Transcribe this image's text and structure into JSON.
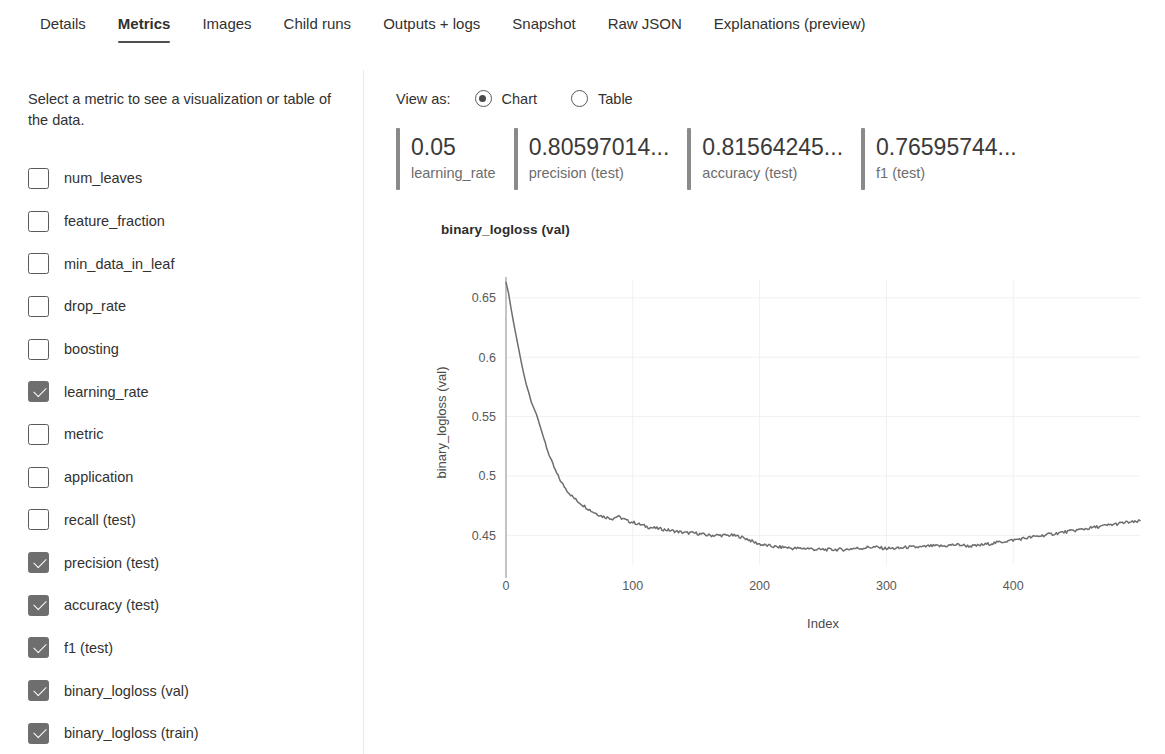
{
  "tabs": [
    {
      "label": "Details",
      "active": false
    },
    {
      "label": "Metrics",
      "active": true
    },
    {
      "label": "Images",
      "active": false
    },
    {
      "label": "Child runs",
      "active": false
    },
    {
      "label": "Outputs + logs",
      "active": false
    },
    {
      "label": "Snapshot",
      "active": false
    },
    {
      "label": "Raw JSON",
      "active": false
    },
    {
      "label": "Explanations (preview)",
      "active": false
    }
  ],
  "sidebar": {
    "help_text": "Select a metric to see a visualization or table of the data.",
    "metrics": [
      {
        "label": "num_leaves",
        "checked": false
      },
      {
        "label": "feature_fraction",
        "checked": false
      },
      {
        "label": "min_data_in_leaf",
        "checked": false
      },
      {
        "label": "drop_rate",
        "checked": false
      },
      {
        "label": "boosting",
        "checked": false
      },
      {
        "label": "learning_rate",
        "checked": true
      },
      {
        "label": "metric",
        "checked": false
      },
      {
        "label": "application",
        "checked": false
      },
      {
        "label": "recall (test)",
        "checked": false
      },
      {
        "label": "precision (test)",
        "checked": true
      },
      {
        "label": "accuracy (test)",
        "checked": true
      },
      {
        "label": "f1 (test)",
        "checked": true
      },
      {
        "label": "binary_logloss (val)",
        "checked": true
      },
      {
        "label": "binary_logloss (train)",
        "checked": true
      }
    ]
  },
  "view_as": {
    "label": "View as:",
    "options": [
      {
        "label": "Chart",
        "selected": true
      },
      {
        "label": "Table",
        "selected": false
      }
    ]
  },
  "kpi_cards": [
    {
      "value": "0.05",
      "name": "learning_rate"
    },
    {
      "value": "0.80597014...",
      "name": "precision (test)"
    },
    {
      "value": "0.81564245...",
      "name": "accuracy (test)"
    },
    {
      "value": "0.76595744...",
      "name": "f1 (test)"
    }
  ],
  "colors": {
    "accent_bar": "#8a8a8a",
    "line": "#6e6e6e",
    "checkbox_checked": "#6e6e6e",
    "tab_underline": "#4f4f4f",
    "gridline": "#f0f0f0"
  },
  "chart_data": {
    "type": "line",
    "title": "binary_logloss (val)",
    "xlabel": "Index",
    "ylabel": "binary_logloss (val)",
    "xlim": [
      0,
      500
    ],
    "ylim": [
      0.425,
      0.665
    ],
    "xticks": [
      0,
      100,
      200,
      300,
      400
    ],
    "yticks": [
      0.45,
      0.5,
      0.55,
      0.6,
      0.65
    ],
    "grid": true,
    "legend": null,
    "series": [
      {
        "name": "binary_logloss (val)",
        "x": [
          0,
          2,
          4,
          6,
          8,
          10,
          12,
          14,
          16,
          18,
          20,
          22,
          24,
          26,
          28,
          30,
          32,
          34,
          36,
          38,
          40,
          44,
          48,
          52,
          56,
          60,
          64,
          68,
          72,
          76,
          80,
          84,
          88,
          92,
          96,
          100,
          106,
          112,
          118,
          124,
          130,
          136,
          142,
          148,
          154,
          160,
          166,
          172,
          178,
          184,
          190,
          196,
          202,
          208,
          214,
          220,
          226,
          232,
          238,
          244,
          250,
          256,
          262,
          268,
          274,
          280,
          286,
          292,
          298,
          304,
          310,
          316,
          322,
          328,
          334,
          340,
          346,
          352,
          358,
          364,
          370,
          376,
          382,
          388,
          394,
          400,
          406,
          412,
          418,
          424,
          430,
          436,
          442,
          448,
          454,
          460,
          466,
          472,
          478,
          484,
          490,
          496,
          500
        ],
        "y": [
          0.663,
          0.654,
          0.641,
          0.629,
          0.618,
          0.607,
          0.596,
          0.586,
          0.577,
          0.57,
          0.562,
          0.557,
          0.552,
          0.545,
          0.538,
          0.531,
          0.524,
          0.518,
          0.512,
          0.507,
          0.502,
          0.494,
          0.488,
          0.483,
          0.479,
          0.476,
          0.473,
          0.47,
          0.468,
          0.466,
          0.465,
          0.464,
          0.466,
          0.464,
          0.462,
          0.461,
          0.459,
          0.457,
          0.456,
          0.455,
          0.454,
          0.453,
          0.452,
          0.452,
          0.451,
          0.45,
          0.45,
          0.45,
          0.45,
          0.449,
          0.447,
          0.444,
          0.442,
          0.441,
          0.44,
          0.44,
          0.439,
          0.439,
          0.439,
          0.438,
          0.438,
          0.438,
          0.438,
          0.438,
          0.439,
          0.439,
          0.44,
          0.44,
          0.439,
          0.439,
          0.439,
          0.44,
          0.44,
          0.44,
          0.441,
          0.441,
          0.441,
          0.442,
          0.442,
          0.441,
          0.441,
          0.442,
          0.443,
          0.444,
          0.445,
          0.446,
          0.447,
          0.448,
          0.449,
          0.45,
          0.451,
          0.452,
          0.453,
          0.454,
          0.455,
          0.456,
          0.457,
          0.458,
          0.459,
          0.46,
          0.461,
          0.461,
          0.462
        ]
      }
    ]
  }
}
